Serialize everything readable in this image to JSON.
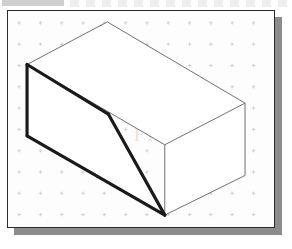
{
  "document": {
    "title": "Isometric Sketch",
    "description": "Isometric pictorial sketch of a rectangular block with a diagonal (chamfered) cut on the left front face, drawn on isometric grid paper",
    "projection": "isometric",
    "units": "grid squares"
  },
  "canvas": {
    "width": 292,
    "height": 249,
    "background_color": "#ffffff"
  },
  "frame": {
    "name": "sketch-sheet",
    "x": 7,
    "y": 10,
    "width": 268,
    "height": 218,
    "fill_color": "#fdfdfd",
    "border_color": "#2b2b2b",
    "border_width": 1,
    "shadow_color": "#8c8c8c",
    "shadow_offset_x": 7,
    "shadow_offset_y": 7
  },
  "grid": {
    "name": "isometric-dot-grid",
    "marker": "plus-cross",
    "marker_color": "#c9c4c0",
    "spacing_x": 21.5,
    "spacing_y": 21.5,
    "origin_x": 11,
    "origin_y": 12,
    "columns": 13,
    "rows": 11,
    "visible": true
  },
  "watermark": {
    "text": "FREE",
    "color": "#c49696",
    "opacity": 0.3,
    "visible": true
  },
  "scan_artifacts": {
    "top_left_bar": {
      "color": "#a8a8a8",
      "x": 2,
      "y": 0,
      "width": 62,
      "height": 6
    },
    "ghost_text_row": {
      "color": "#969696",
      "x": 70,
      "y": 0,
      "width": 220,
      "height": 7
    }
  },
  "drawing": {
    "name": "chamfered-block",
    "stroke_thin_color": "#6e6e6e",
    "stroke_thin_width": 1,
    "stroke_thick_color": "#1a1a1a",
    "stroke_thick_width": 3.2,
    "face_fill": "#ffffff",
    "vertices": {
      "top_apex": {
        "label": "A",
        "x": 100,
        "y": 11
      },
      "top_left": {
        "label": "B",
        "x": 19,
        "y": 54
      },
      "top_right": {
        "label": "C",
        "x": 239,
        "y": 93
      },
      "top_front": {
        "label": "D",
        "x": 158,
        "y": 135
      },
      "front_bottom": {
        "label": "E",
        "x": 158,
        "y": 206
      },
      "right_bottom": {
        "label": "F",
        "x": 239,
        "y": 166
      },
      "left_bottom": {
        "label": "G",
        "x": 19,
        "y": 126
      },
      "cut_bend": {
        "label": "H",
        "x": 101,
        "y": 104
      }
    },
    "edges": [
      {
        "name": "top-face-back-left",
        "from": "top_left",
        "to": "top_apex",
        "weight": "thin"
      },
      {
        "name": "top-face-back-right",
        "from": "top_apex",
        "to": "top_right",
        "weight": "thin"
      },
      {
        "name": "top-face-front-right",
        "from": "top_right",
        "to": "top_front",
        "weight": "thin"
      },
      {
        "name": "top-face-front-left",
        "from": "top_front",
        "to": "top_left",
        "weight": "thin"
      },
      {
        "name": "right-vertical",
        "from": "top_right",
        "to": "right_bottom",
        "weight": "thin"
      },
      {
        "name": "front-vertical",
        "from": "top_front",
        "to": "front_bottom",
        "weight": "thin"
      },
      {
        "name": "bottom-right",
        "from": "front_bottom",
        "to": "right_bottom",
        "weight": "thin"
      },
      {
        "name": "cut-upper-slope",
        "from": "top_left",
        "to": "cut_bend",
        "weight": "thick"
      },
      {
        "name": "cut-lower-slope",
        "from": "cut_bend",
        "to": "front_bottom",
        "weight": "thick"
      },
      {
        "name": "left-vertical",
        "from": "top_left",
        "to": "left_bottom",
        "weight": "thick"
      },
      {
        "name": "bottom-left",
        "from": "left_bottom",
        "to": "front_bottom",
        "weight": "thick"
      }
    ],
    "faces": [
      {
        "name": "top-face",
        "vertices": [
          "top_left",
          "top_apex",
          "top_right",
          "top_front"
        ],
        "fill": "#ffffff"
      },
      {
        "name": "right-face",
        "vertices": [
          "top_front",
          "top_right",
          "right_bottom",
          "front_bottom"
        ],
        "fill": "#ffffff"
      },
      {
        "name": "cut-slope-face",
        "vertices": [
          "top_left",
          "cut_bend",
          "front_bottom",
          "left_bottom"
        ],
        "fill": "#ffffff"
      }
    ]
  }
}
